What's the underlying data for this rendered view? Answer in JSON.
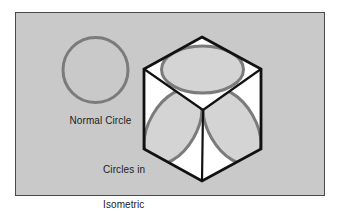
{
  "figure": {
    "background_color": "#ffffff",
    "panel": {
      "fill_color": "#c9c9c9",
      "border_color": "#4a4a4a",
      "x": 15,
      "y": 12,
      "width": 310,
      "height": 184
    },
    "labels": {
      "normal_circle": "Normal Circle",
      "isometric_line1": "Circles in",
      "isometric_line2": "Isometric",
      "isometric_line3": "Projection",
      "text_color": "#1c1c1c"
    },
    "normal_circle": {
      "name": "Normal Circle",
      "shape": "circle",
      "center_x": 95.5,
      "center_y": 70,
      "radius": 32.5,
      "stroke_color": "#7b7b7b",
      "stroke_width": 3,
      "fill": "none"
    },
    "cube": {
      "name": "Isometric cube",
      "stroke_color": "#111111",
      "stroke_width": 2.6,
      "face_fill": "#ffffff",
      "inner_edge_color": "#111111",
      "vertices": {
        "top": [
          202,
          37
        ],
        "upper_left": [
          144,
          69
        ],
        "upper_right": [
          261,
          69
        ],
        "lower_left": [
          144,
          149
        ],
        "lower_right": [
          261,
          149
        ],
        "bottom": [
          202,
          181
        ],
        "center": [
          203,
          110
        ]
      }
    },
    "isometric_ellipses": [
      {
        "name": "top-face-ellipse",
        "face": "top",
        "center_x": 202.5,
        "center_y": 69.5,
        "radius_x": 41,
        "radius_y": 23.5,
        "rotation_deg": 0,
        "stroke_color": "#7b7b7b",
        "stroke_width": 3,
        "fill_color": "#d4d4d4"
      },
      {
        "name": "left-face-ellipse",
        "face": "left",
        "center_x": 173,
        "center_y": 126.5,
        "radius_x": 41,
        "radius_y": 23.5,
        "rotation_deg": -60,
        "stroke_color": "#7b7b7b",
        "stroke_width": 3,
        "fill_color": "#d4d4d4"
      },
      {
        "name": "right-face-ellipse",
        "face": "right",
        "center_x": 232,
        "center_y": 126.5,
        "radius_x": 41,
        "radius_y": 23.5,
        "rotation_deg": 60,
        "stroke_color": "#7b7b7b",
        "stroke_width": 3,
        "fill_color": "#d4d4d4"
      }
    ]
  }
}
